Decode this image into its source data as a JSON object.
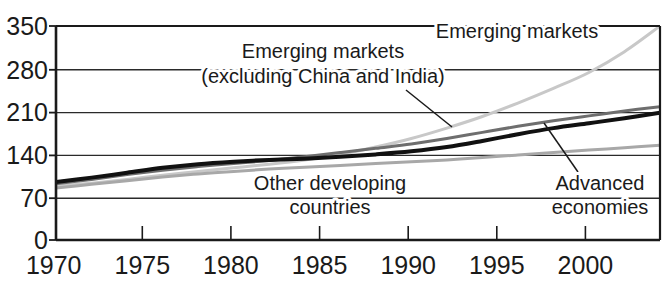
{
  "chart_data": {
    "type": "line",
    "title": "",
    "subtitle": "",
    "xlabel": "",
    "ylabel": "",
    "xlim": [
      1970,
      2004
    ],
    "ylim": [
      0,
      350
    ],
    "grid": true,
    "legend_position": "inline-annotations",
    "x_ticks": [
      "1970",
      "1975",
      "1980",
      "1985",
      "1990",
      "1995",
      "2000"
    ],
    "x_tick_values": [
      1970,
      1975,
      1980,
      1985,
      1990,
      1995,
      2000
    ],
    "y_ticks": [
      "0",
      "70",
      "140",
      "210",
      "280",
      "350"
    ],
    "y_tick_values": [
      0,
      70,
      140,
      210,
      280,
      350
    ],
    "x": [
      1970,
      1972,
      1974,
      1976,
      1978,
      1980,
      1982,
      1984,
      1986,
      1988,
      1990,
      1992,
      1994,
      1996,
      1998,
      2000,
      2002,
      2004
    ],
    "series": [
      {
        "name": "Emerging markets",
        "color": "#c8c8c8",
        "width": 3,
        "values": [
          88,
          93,
          99,
          106,
          112,
          118,
          124,
          131,
          140,
          152,
          166,
          183,
          202,
          224,
          248,
          274,
          308,
          350
        ]
      },
      {
        "name": "Emerging markets (excluding China and India)",
        "color": "#6e6e6e",
        "width": 3,
        "values": [
          92,
          99,
          107,
          114,
          120,
          125,
          130,
          136,
          143,
          150,
          157,
          166,
          176,
          186,
          195,
          203,
          211,
          218
        ]
      },
      {
        "name": "Other developing countries",
        "color": "#111111",
        "width": 4,
        "values": [
          95,
          102,
          110,
          118,
          124,
          128,
          131,
          133,
          136,
          140,
          145,
          152,
          162,
          173,
          183,
          191,
          199,
          208
        ]
      },
      {
        "name": "Advanced economies",
        "color": "#a8a8a8",
        "width": 3,
        "values": [
          85,
          91,
          97,
          103,
          108,
          112,
          116,
          119,
          122,
          125,
          128,
          131,
          135,
          139,
          143,
          147,
          151,
          155
        ]
      }
    ],
    "annotations": [
      {
        "id": "emerging-markets-label",
        "text": "Emerging markets",
        "x": 517,
        "y": 38,
        "anchor": "middle"
      },
      {
        "id": "emerging-markets-ex-label-line1",
        "text": "Emerging markets",
        "x": 323,
        "y": 58,
        "anchor": "middle"
      },
      {
        "id": "emerging-markets-ex-label-line2",
        "text": "(excluding China and India)",
        "x": 323,
        "y": 83,
        "anchor": "middle"
      },
      {
        "id": "other-developing-label-line1",
        "text": "Other developing",
        "x": 330,
        "y": 190,
        "anchor": "middle"
      },
      {
        "id": "other-developing-label-line2",
        "text": "countries",
        "x": 330,
        "y": 214,
        "anchor": "middle"
      },
      {
        "id": "advanced-economies-label-line1",
        "text": "Advanced",
        "x": 600,
        "y": 190,
        "anchor": "middle"
      },
      {
        "id": "advanced-economies-label-line2",
        "text": "economies",
        "x": 600,
        "y": 214,
        "anchor": "middle"
      }
    ],
    "colors": {
      "axis": "#1a1a1a",
      "grid": "#1a1a1a",
      "background": "#ffffff",
      "text": "#1a1a1a"
    }
  },
  "ytick": {
    "t0": "0",
    "t70": "70",
    "t140": "140",
    "t210": "210",
    "t280": "280",
    "t350": "350"
  },
  "xtick": {
    "t1970": "1970",
    "t1975": "1975",
    "t1980": "1980",
    "t1985": "1985",
    "t1990": "1990",
    "t1995": "1995",
    "t2000": "2000"
  },
  "labels": {
    "emerging_markets": "Emerging markets",
    "emerging_markets_ex_1": "Emerging markets",
    "emerging_markets_ex_2": "(excluding China and India)",
    "other_developing_1": "Other developing",
    "other_developing_2": "countries",
    "advanced_1": "Advanced",
    "advanced_2": "economies"
  }
}
